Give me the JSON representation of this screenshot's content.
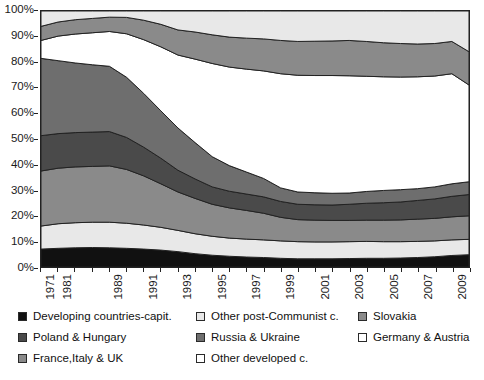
{
  "chart_data": {
    "type": "area",
    "stacked": true,
    "title": "",
    "xlabel": "",
    "ylabel": "",
    "ylim": [
      0,
      100
    ],
    "ytick_labels": [
      "100%",
      "90%",
      "80%",
      "70%",
      "60%",
      "50%",
      "40%",
      "30%",
      "20%",
      "10%",
      "0%"
    ],
    "ytick_values": [
      100,
      90,
      80,
      70,
      60,
      50,
      40,
      30,
      20,
      10,
      0
    ],
    "grid": false,
    "legend_position": "bottom",
    "x": [
      1971,
      1981,
      1985,
      1987,
      1989,
      1990,
      1991,
      1992,
      1993,
      1994,
      1995,
      1996,
      1997,
      1998,
      1999,
      2000,
      2001,
      2002,
      2003,
      2004,
      2005,
      2006,
      2007,
      2008,
      2009,
      2010
    ],
    "xtick_labels": [
      "1971",
      "1981",
      "",
      "",
      "1989",
      "",
      "1991",
      "",
      "1993",
      "",
      "1995",
      "",
      "1997",
      "",
      "1999",
      "",
      "2001",
      "",
      "2003",
      "",
      "2005",
      "",
      "2007",
      "",
      "2009",
      ""
    ],
    "series": [
      {
        "name": "Developing countries-capit.",
        "color": "#111111",
        "values": [
          7.0,
          7.3,
          7.5,
          7.6,
          7.5,
          7.3,
          7.0,
          6.6,
          6.0,
          5.2,
          4.6,
          4.2,
          3.9,
          3.7,
          3.4,
          3.2,
          3.2,
          3.2,
          3.3,
          3.4,
          3.4,
          3.5,
          3.7,
          4.0,
          4.5,
          4.8
        ]
      },
      {
        "name": "Other post-Communist c.",
        "color": "#e8e8e8",
        "values": [
          9.0,
          9.6,
          9.8,
          9.9,
          10.0,
          9.8,
          9.4,
          8.9,
          8.3,
          7.8,
          7.4,
          7.1,
          7.0,
          6.9,
          6.8,
          6.7,
          6.6,
          6.6,
          6.6,
          6.6,
          6.5,
          6.4,
          6.3,
          6.2,
          6.1,
          6.0
        ]
      },
      {
        "name": "Slovakia",
        "color": "#8a8a8a",
        "values": [
          21.5,
          21.7,
          21.8,
          21.8,
          22.0,
          21.0,
          19.2,
          17.0,
          15.0,
          13.8,
          12.5,
          11.8,
          11.2,
          10.4,
          9.2,
          8.6,
          8.5,
          8.4,
          8.3,
          8.3,
          8.4,
          8.5,
          8.7,
          8.8,
          9.0,
          9.2
        ]
      },
      {
        "name": "Poland & Hungary",
        "color": "#4a4a4a",
        "values": [
          13.8,
          13.5,
          13.4,
          13.4,
          13.4,
          12.5,
          11.2,
          10.0,
          8.5,
          7.6,
          6.8,
          6.5,
          6.4,
          6.4,
          6.2,
          6.0,
          6.0,
          6.0,
          6.3,
          6.6,
          6.8,
          7.0,
          7.3,
          7.6,
          8.0,
          8.3
        ]
      },
      {
        "name": "Russia & Ukraine",
        "color": "#6e6e6e",
        "values": [
          30.2,
          28.5,
          27.2,
          26.3,
          25.5,
          23.5,
          21.0,
          18.5,
          16.5,
          14.2,
          11.8,
          10.0,
          8.6,
          7.2,
          5.3,
          4.8,
          4.7,
          4.6,
          4.4,
          4.6,
          4.8,
          4.8,
          4.6,
          4.7,
          4.9,
          5.0
        ]
      },
      {
        "name": "Germany & Austria",
        "color": "#ffffff",
        "values": [
          7.0,
          9.6,
          11.3,
          12.5,
          13.6,
          17.0,
          21.0,
          25.0,
          28.5,
          32.6,
          36.4,
          38.5,
          40.2,
          42.0,
          44.6,
          45.6,
          45.8,
          46.0,
          45.8,
          45.0,
          44.4,
          44.0,
          43.7,
          43.3,
          43.0,
          37.8
        ]
      },
      {
        "name": "France,Italy & UK",
        "color": "#8a8a8a",
        "values": [
          5.5,
          5.5,
          5.6,
          5.6,
          5.6,
          6.4,
          7.6,
          8.8,
          9.8,
          10.6,
          11.2,
          11.7,
          12.1,
          12.5,
          13.0,
          13.2,
          13.4,
          13.5,
          13.8,
          13.6,
          13.3,
          13.1,
          12.8,
          12.7,
          12.6,
          13.0
        ]
      },
      {
        "name": "Other developed c.",
        "color": "#e8e8e8",
        "values": [
          6.0,
          4.3,
          3.4,
          2.9,
          2.4,
          2.5,
          3.6,
          5.2,
          7.4,
          8.2,
          9.3,
          10.2,
          10.6,
          10.9,
          11.5,
          11.9,
          11.8,
          11.7,
          11.5,
          11.9,
          12.4,
          12.7,
          12.9,
          12.7,
          11.9,
          15.9
        ]
      }
    ]
  },
  "legend": {
    "columns": [
      [
        {
          "label": "Developing countries-capit.",
          "color": "#111111"
        },
        {
          "label": "Poland & Hungary",
          "color": "#4a4a4a"
        },
        {
          "label": "France,Italy & UK",
          "color": "#8a8a8a"
        }
      ],
      [
        {
          "label": "Other post-Communist c.",
          "color": "#e8e8e8"
        },
        {
          "label": "Russia & Ukraine",
          "color": "#6e6e6e"
        },
        {
          "label": "Other developed c.",
          "color": "#ffffff"
        }
      ],
      [
        {
          "label": "Slovakia",
          "color": "#8a8a8a"
        },
        {
          "label": "Germany & Austria",
          "color": "#ffffff"
        }
      ]
    ]
  }
}
